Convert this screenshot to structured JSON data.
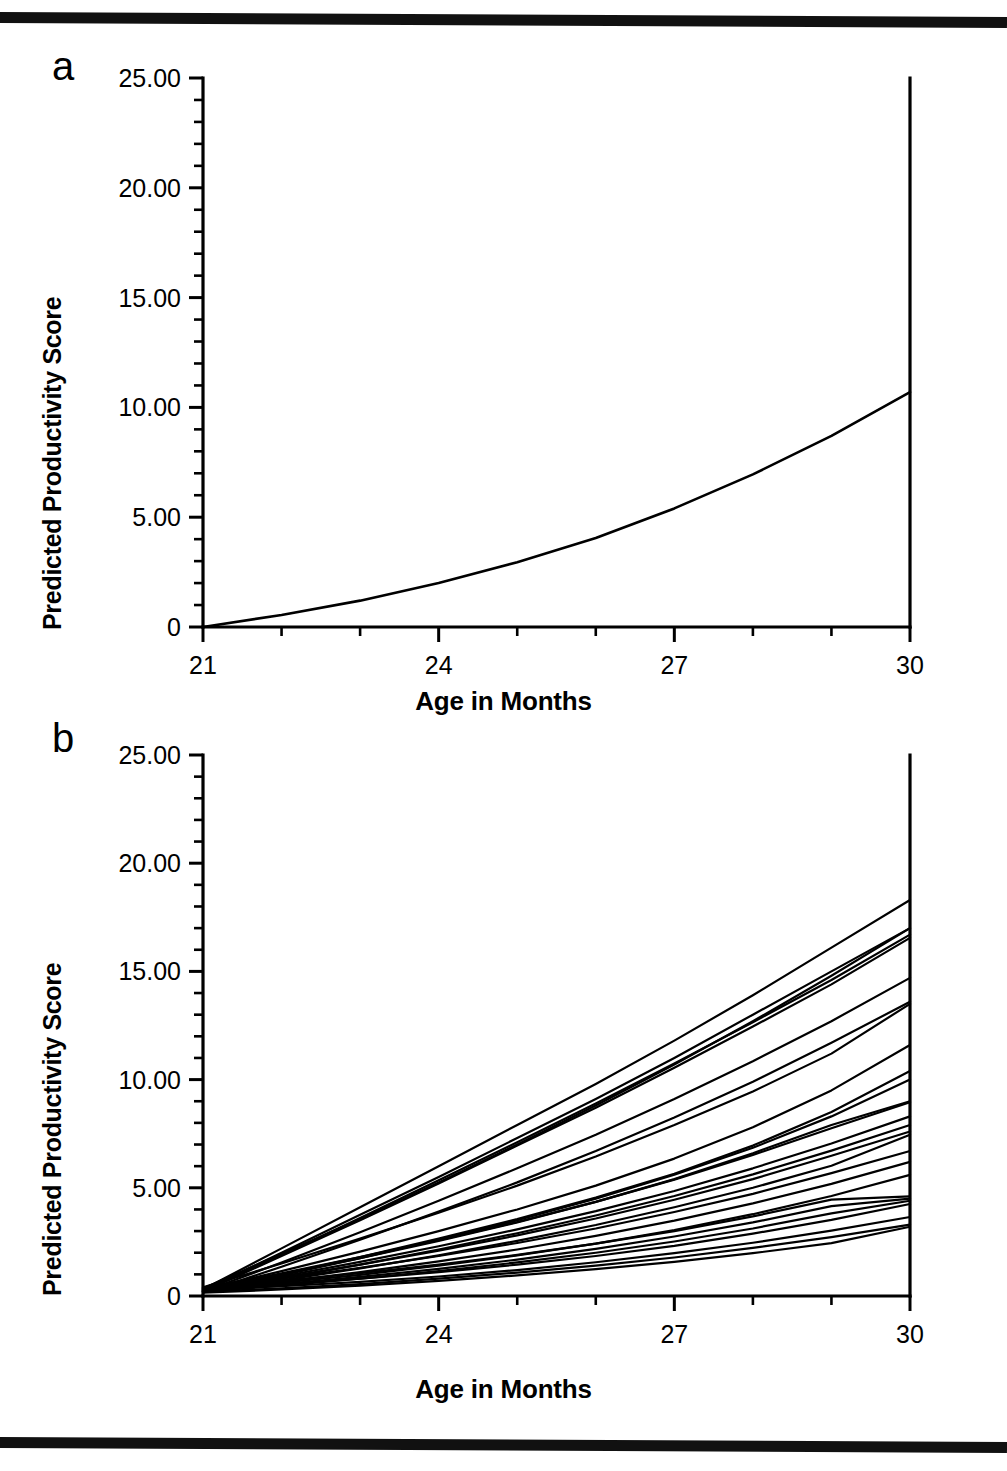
{
  "figure": {
    "panels": [
      {
        "id": "a",
        "letter": "a",
        "ylabel": "Predicted Productivity Score",
        "xlabel": "Age in Months"
      },
      {
        "id": "b",
        "letter": "b",
        "ylabel": "Predicted Productivity Score",
        "xlabel": "Age in Months"
      }
    ]
  },
  "chart_data": [
    {
      "type": "line",
      "panel": "a",
      "title": "",
      "xlabel": "Age in Months",
      "ylabel": "Predicted Productivity Score",
      "xlim": [
        21,
        30
      ],
      "ylim": [
        0,
        25
      ],
      "xticks": [
        21,
        24,
        27,
        30
      ],
      "xtick_labels": [
        "21",
        "24",
        "27",
        "30"
      ],
      "x_minor_tick_step": 1,
      "yticks": [
        0,
        5,
        10,
        15,
        20,
        25
      ],
      "ytick_labels": [
        "0",
        "5.00",
        "10.00",
        "15.00",
        "20.00",
        "25.00"
      ],
      "y_minor_tick_step": 1,
      "grid": false,
      "legend": "none",
      "series": [
        {
          "name": "Average predicted growth curve",
          "x": [
            21,
            22,
            23,
            24,
            25,
            26,
            27,
            28,
            29,
            30
          ],
          "values": [
            0.0,
            0.55,
            1.2,
            2.0,
            2.95,
            4.05,
            5.4,
            6.95,
            8.7,
            10.7
          ]
        }
      ]
    },
    {
      "type": "line",
      "panel": "b",
      "title": "",
      "xlabel": "Age in Months",
      "ylabel": "Predicted Productivity Score",
      "xlim": [
        21,
        30
      ],
      "ylim": [
        0,
        25
      ],
      "xticks": [
        21,
        24,
        27,
        30
      ],
      "xtick_labels": [
        "21",
        "24",
        "27",
        "30"
      ],
      "x_minor_tick_step": 1,
      "yticks": [
        0,
        5,
        10,
        15,
        20,
        25
      ],
      "ytick_labels": [
        "0",
        "5.00",
        "10.00",
        "15.00",
        "20.00",
        "25.00"
      ],
      "y_minor_tick_step": 1,
      "grid": false,
      "legend": "none",
      "x": [
        21,
        22,
        23,
        24,
        25,
        26,
        27,
        28,
        29,
        30
      ],
      "series": [
        {
          "name": "child-01",
          "values": [
            0.3,
            2.2,
            4.1,
            6.0,
            7.9,
            9.8,
            11.8,
            13.9,
            16.1,
            18.3
          ]
        },
        {
          "name": "child-02",
          "values": [
            0.25,
            2.0,
            3.75,
            5.5,
            7.3,
            9.1,
            11.0,
            13.0,
            15.0,
            17.0
          ]
        },
        {
          "name": "child-03",
          "values": [
            0.2,
            1.9,
            3.6,
            5.35,
            7.1,
            8.9,
            10.75,
            12.65,
            14.6,
            16.7
          ]
        },
        {
          "name": "child-04",
          "values": [
            0.2,
            1.85,
            3.5,
            5.2,
            6.95,
            8.7,
            10.55,
            12.45,
            14.4,
            16.55
          ]
        },
        {
          "name": "child-05",
          "values": [
            0.35,
            1.95,
            3.55,
            5.25,
            7.0,
            8.8,
            10.7,
            12.7,
            14.8,
            17.0
          ]
        },
        {
          "name": "child-06",
          "values": [
            0.2,
            1.55,
            2.95,
            4.4,
            5.9,
            7.45,
            9.1,
            10.85,
            12.7,
            14.7
          ]
        },
        {
          "name": "child-07",
          "values": [
            0.15,
            1.35,
            2.6,
            3.9,
            5.25,
            6.7,
            8.25,
            9.9,
            11.7,
            13.6
          ]
        },
        {
          "name": "child-08",
          "values": [
            0.4,
            1.5,
            2.65,
            3.85,
            5.1,
            6.45,
            7.9,
            9.45,
            11.2,
            13.5
          ]
        },
        {
          "name": "child-09",
          "values": [
            0.3,
            1.15,
            2.05,
            3.0,
            4.0,
            5.1,
            6.35,
            7.8,
            9.5,
            11.6
          ]
        },
        {
          "name": "child-10",
          "values": [
            0.25,
            1.0,
            1.8,
            2.65,
            3.55,
            4.55,
            5.65,
            6.95,
            8.5,
            10.4
          ]
        },
        {
          "name": "child-11",
          "values": [
            0.2,
            0.95,
            1.75,
            2.6,
            3.5,
            4.5,
            5.6,
            6.85,
            8.3,
            10.0
          ]
        },
        {
          "name": "child-12",
          "values": [
            0.3,
            1.0,
            1.75,
            2.55,
            3.4,
            4.35,
            5.4,
            6.6,
            7.9,
            9.0
          ]
        },
        {
          "name": "child-13",
          "values": [
            0.35,
            1.05,
            1.8,
            2.58,
            3.42,
            4.35,
            5.38,
            6.52,
            7.75,
            8.95
          ]
        },
        {
          "name": "child-14",
          "values": [
            0.25,
            0.9,
            1.58,
            2.3,
            3.08,
            3.92,
            4.85,
            5.9,
            7.05,
            8.3
          ]
        },
        {
          "name": "child-15",
          "values": [
            0.2,
            0.8,
            1.45,
            2.15,
            2.9,
            3.72,
            4.62,
            5.62,
            6.72,
            7.9
          ]
        },
        {
          "name": "child-16",
          "values": [
            0.3,
            0.85,
            1.45,
            2.1,
            2.8,
            3.58,
            4.45,
            5.4,
            6.48,
            7.6
          ]
        },
        {
          "name": "child-17",
          "values": [
            0.2,
            0.72,
            1.28,
            1.88,
            2.55,
            3.28,
            4.1,
            5.0,
            6.02,
            7.45
          ]
        },
        {
          "name": "child-18",
          "values": [
            0.35,
            0.8,
            1.3,
            1.85,
            2.45,
            3.12,
            3.88,
            4.72,
            5.68,
            6.7
          ]
        },
        {
          "name": "child-19",
          "values": [
            0.25,
            0.65,
            1.1,
            1.6,
            2.15,
            2.78,
            3.48,
            4.28,
            5.18,
            6.2
          ]
        },
        {
          "name": "child-20",
          "values": [
            0.3,
            0.62,
            0.98,
            1.4,
            1.88,
            2.42,
            3.05,
            3.78,
            4.62,
            5.6
          ]
        },
        {
          "name": "child-21",
          "values": [
            0.4,
            0.7,
            1.05,
            1.45,
            1.9,
            2.42,
            3.0,
            3.68,
            4.45,
            4.6
          ]
        },
        {
          "name": "child-22",
          "values": [
            0.25,
            0.55,
            0.88,
            1.25,
            1.68,
            2.18,
            2.75,
            3.4,
            4.15,
            4.5
          ]
        },
        {
          "name": "child-23",
          "values": [
            0.2,
            0.48,
            0.8,
            1.15,
            1.55,
            2.0,
            2.52,
            3.12,
            3.82,
            4.4
          ]
        },
        {
          "name": "child-24",
          "values": [
            0.35,
            0.55,
            0.8,
            1.1,
            1.45,
            1.85,
            2.32,
            2.88,
            3.52,
            4.25
          ]
        },
        {
          "name": "child-25",
          "values": [
            0.3,
            0.45,
            0.65,
            0.9,
            1.2,
            1.56,
            1.98,
            2.46,
            3.02,
            3.65
          ]
        },
        {
          "name": "child-26",
          "values": [
            0.2,
            0.35,
            0.55,
            0.8,
            1.08,
            1.4,
            1.78,
            2.22,
            2.72,
            3.3
          ]
        },
        {
          "name": "child-27",
          "values": [
            0.15,
            0.3,
            0.48,
            0.7,
            0.95,
            1.24,
            1.58,
            1.98,
            2.44,
            3.2
          ]
        }
      ]
    }
  ]
}
